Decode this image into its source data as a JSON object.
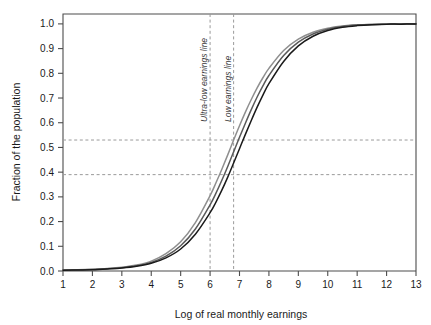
{
  "chart_data": {
    "type": "line",
    "title": "",
    "xlabel": "Log of real monthly earnings",
    "ylabel": "Fraction of the population",
    "xlim": [
      1,
      13
    ],
    "ylim": [
      0.0,
      1.04
    ],
    "grid": false,
    "legend_position": "none",
    "x_ticks": [
      1,
      2,
      3,
      4,
      5,
      6,
      7,
      8,
      9,
      10,
      11,
      12,
      13
    ],
    "x_tick_labels": [
      "1",
      "2",
      "3",
      "4",
      "5",
      "6",
      "7",
      "8",
      "9",
      "10",
      "11",
      "12",
      "13"
    ],
    "y_ticks": [
      0.0,
      0.1,
      0.2,
      0.3,
      0.4,
      0.5,
      0.6,
      0.7,
      0.8,
      0.9,
      1.0
    ],
    "y_tick_labels": [
      "0.0",
      "0.1",
      "0.2",
      "0.3",
      "0.4",
      "0.5",
      "0.6",
      "0.7",
      "0.8",
      "0.9",
      "1.0"
    ],
    "x": [
      1.0,
      1.5,
      2.0,
      2.5,
      3.0,
      3.5,
      4.0,
      4.5,
      5.0,
      5.5,
      6.0,
      6.2,
      6.4,
      6.6,
      6.8,
      7.0,
      7.2,
      7.4,
      7.6,
      7.8,
      8.0,
      8.5,
      9.0,
      9.5,
      10.0,
      10.5,
      11.0,
      11.5,
      12.0,
      12.5,
      13.0
    ],
    "series": [
      {
        "name": "curve-light",
        "color": "#8f8f8f",
        "values": [
          0.004,
          0.005,
          0.007,
          0.01,
          0.015,
          0.024,
          0.04,
          0.07,
          0.118,
          0.196,
          0.305,
          0.357,
          0.412,
          0.47,
          0.53,
          0.588,
          0.643,
          0.694,
          0.741,
          0.783,
          0.82,
          0.892,
          0.938,
          0.966,
          0.982,
          0.991,
          0.996,
          0.998,
          0.999,
          1.0,
          1.0
        ]
      },
      {
        "name": "curve-medium",
        "color": "#5a5a5a",
        "values": [
          0.003,
          0.004,
          0.006,
          0.009,
          0.013,
          0.021,
          0.035,
          0.06,
          0.102,
          0.17,
          0.268,
          0.315,
          0.367,
          0.423,
          0.482,
          0.541,
          0.598,
          0.653,
          0.704,
          0.75,
          0.791,
          0.872,
          0.926,
          0.959,
          0.978,
          0.989,
          0.995,
          0.998,
          0.999,
          1.0,
          1.0
        ]
      },
      {
        "name": "curve-dark",
        "color": "#1a1a1a",
        "values": [
          0.003,
          0.004,
          0.005,
          0.008,
          0.012,
          0.019,
          0.031,
          0.053,
          0.089,
          0.149,
          0.236,
          0.279,
          0.327,
          0.38,
          0.437,
          0.495,
          0.553,
          0.609,
          0.663,
          0.713,
          0.758,
          0.848,
          0.911,
          0.95,
          0.973,
          0.986,
          0.993,
          0.997,
          0.999,
          0.999,
          1.0
        ]
      }
    ],
    "reference_lines": [
      {
        "name": "ultra-low-earnings-line",
        "orientation": "vertical",
        "value": 6.0,
        "label": "Ultra-low earnings line",
        "style": "dashed",
        "color": "#9a9a9a"
      },
      {
        "name": "low-earnings-line",
        "orientation": "vertical",
        "value": 6.8,
        "label": "Low earnings line",
        "style": "dashed",
        "color": "#9a9a9a"
      },
      {
        "name": "upper-fraction-line",
        "orientation": "horizontal",
        "value": 0.53,
        "label": "",
        "style": "dashed",
        "color": "#9a9a9a"
      },
      {
        "name": "lower-fraction-line",
        "orientation": "horizontal",
        "value": 0.39,
        "label": "",
        "style": "dashed",
        "color": "#9a9a9a"
      }
    ]
  }
}
